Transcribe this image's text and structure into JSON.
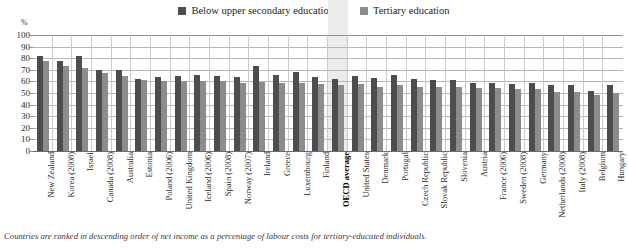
{
  "legend": {
    "items": [
      {
        "label": "Below upper secondary education",
        "color": "#4d4d4d",
        "icon": "square-swatch-icon"
      },
      {
        "label": "Tertiary education",
        "color": "#8c8c8c",
        "icon": "square-swatch-icon"
      }
    ]
  },
  "axis": {
    "unit": "%",
    "ticks": [
      "100",
      "90",
      "80",
      "70",
      "60",
      "50",
      "40",
      "30",
      "20",
      "10",
      "0"
    ]
  },
  "footnote": "Countries are ranked in descending order of net income as a percentage of labour costs for tertiary-educated individuals.",
  "highlight": {
    "category": "OECD average",
    "color": "#ececec"
  },
  "chart_data": {
    "type": "bar",
    "title": "",
    "subtitle": "",
    "xlabel": "",
    "ylabel": "%",
    "ylim": [
      0,
      100
    ],
    "ytick_step": 10,
    "grid": true,
    "legend_position": "top-center",
    "orientation": "vertical",
    "categories": [
      "New Zealand",
      "Korea (2008)",
      "Israel",
      "Canada (2008)",
      "Australia",
      "Estonia",
      "Poland (2006)",
      "United Kingdom",
      "Iceland (2006)",
      "Spain (2008)",
      "Norway (2007)",
      "Ireland",
      "Greece",
      "Luxembourg",
      "Finland",
      "OECD average",
      "United States",
      "Denmark",
      "Portugal",
      "Czech Republic",
      "Slovak Republic",
      "Slovenia",
      "Austria",
      "France (2006)",
      "Sweden (2008)",
      "Germany",
      "Netherlands (2008)",
      "Italy (2008)",
      "Belgium",
      "Hungary"
    ],
    "series": [
      {
        "name": "Below upper secondary education",
        "color": "#4d4d4d",
        "values": [
          82,
          77.5,
          82,
          70,
          69.5,
          62,
          63.5,
          64.5,
          65.5,
          64.5,
          63.5,
          73.5,
          65.5,
          68.5,
          63.5,
          62,
          64.5,
          63,
          65.5,
          62.5,
          61,
          61.5,
          59,
          59,
          58,
          58.5,
          57,
          56.5,
          51.5,
          56.5
        ],
        "ylim": [
          0,
          100
        ]
      },
      {
        "name": "Tertiary education",
        "color": "#8c8c8c",
        "values": [
          77.5,
          73,
          71.5,
          67,
          64.5,
          61,
          60.5,
          60,
          60.5,
          60,
          59,
          59.5,
          58.5,
          58.5,
          58,
          56.5,
          58,
          55.5,
          56.5,
          55,
          55,
          55,
          54.5,
          54,
          53.5,
          53.5,
          51,
          51,
          48,
          50
        ],
        "ylim": [
          0,
          100
        ]
      }
    ]
  }
}
